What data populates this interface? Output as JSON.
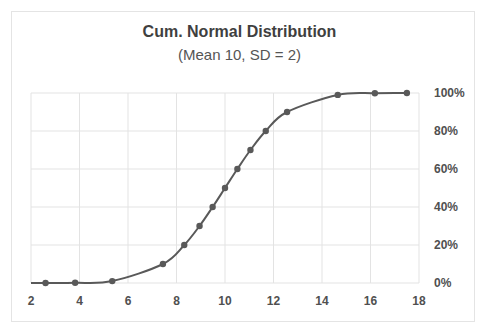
{
  "chart_data": {
    "type": "line",
    "title": "Cum. Normal Distribution",
    "subtitle": "(Mean 10, SD = 2)",
    "xlabel": "",
    "ylabel": "",
    "xlim": [
      2,
      18
    ],
    "ylim": [
      0,
      1
    ],
    "x_ticks": [
      2,
      4,
      6,
      8,
      10,
      12,
      14,
      16,
      18
    ],
    "x_tick_labels": [
      "2",
      "4",
      "6",
      "8",
      "10",
      "12",
      "14",
      "16",
      "18"
    ],
    "y_ticks": [
      0,
      0.2,
      0.4,
      0.6,
      0.8,
      1.0
    ],
    "y_tick_labels": [
      "0%",
      "20%",
      "40%",
      "60%",
      "80%",
      "100%"
    ],
    "y_axis_side": "right",
    "grid": true,
    "legend": "none",
    "line_color": "#595959",
    "series": [
      {
        "name": "Cumulative probability",
        "x": [
          2.6,
          3.82,
          5.35,
          7.44,
          8.32,
          8.95,
          9.49,
          10.0,
          10.51,
          11.05,
          11.68,
          12.56,
          14.65,
          16.18,
          17.5
        ],
        "values": [
          0.0001,
          0.001,
          0.01,
          0.1,
          0.2,
          0.3,
          0.4,
          0.5,
          0.6,
          0.7,
          0.8,
          0.9,
          0.99,
          0.999,
          0.9999
        ]
      }
    ]
  }
}
